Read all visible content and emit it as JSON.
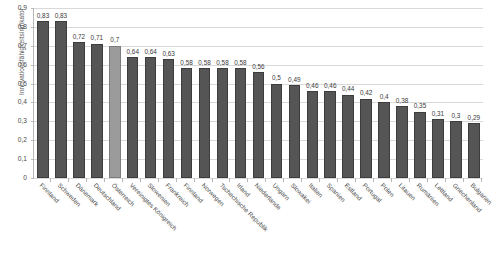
{
  "chart_data": {
    "type": "bar",
    "title": "",
    "subtitle": "",
    "xlabel": "",
    "ylabel": "Innovationsfähigkeitsindikator",
    "ylim": [
      0,
      0.9
    ],
    "ytick_labels": [
      "0,9",
      "0,8",
      "0,7",
      "0,6",
      "0,5",
      "0,4",
      "0,3",
      "0,2",
      "0,1",
      "0"
    ],
    "ytick_values": [
      0.9,
      0.8,
      0.7,
      0.6,
      0.5,
      0.4,
      0.3,
      0.2,
      0.1,
      0
    ],
    "grid": true,
    "legend": "none",
    "decimal_separator": ",",
    "bar_color": "#555555",
    "highlight_color": "#9b9b9b",
    "highlight_category": "Österreich",
    "categories": [
      "Finnland",
      "Schweden",
      "Dänemark",
      "Deutschland",
      "Österreich",
      "Vereinigtes Königreich",
      "Slowenien",
      "Frankreich",
      "Finnland",
      "Norwegen",
      "Tschechische Republik",
      "Irland",
      "Niederlande",
      "Ungarn",
      "Slowakei",
      "Italien",
      "Spanien",
      "Estland",
      "Portugal",
      "Polen",
      "Litauen",
      "Rumänien",
      "Lettland",
      "Griechenland",
      "Bulgarien"
    ],
    "values": [
      0.83,
      0.83,
      0.72,
      0.71,
      0.7,
      0.64,
      0.64,
      0.63,
      0.58,
      0.58,
      0.58,
      0.58,
      0.56,
      0.5,
      0.49,
      0.46,
      0.46,
      0.44,
      0.42,
      0.4,
      0.38,
      0.35,
      0.31,
      0.3,
      0.29
    ],
    "value_labels": [
      "0,83",
      "0,83",
      "0,72",
      "0,71",
      "0,7",
      "0,64",
      "0,64",
      "0,63",
      "0,58",
      "0,58",
      "0,58",
      "0,58",
      "0,56",
      "0,5",
      "0,49",
      "0,46",
      "0,46",
      "0,44",
      "0,42",
      "0,4",
      "0,38",
      "0,35",
      "0,31",
      "0,3",
      "0,29"
    ]
  }
}
